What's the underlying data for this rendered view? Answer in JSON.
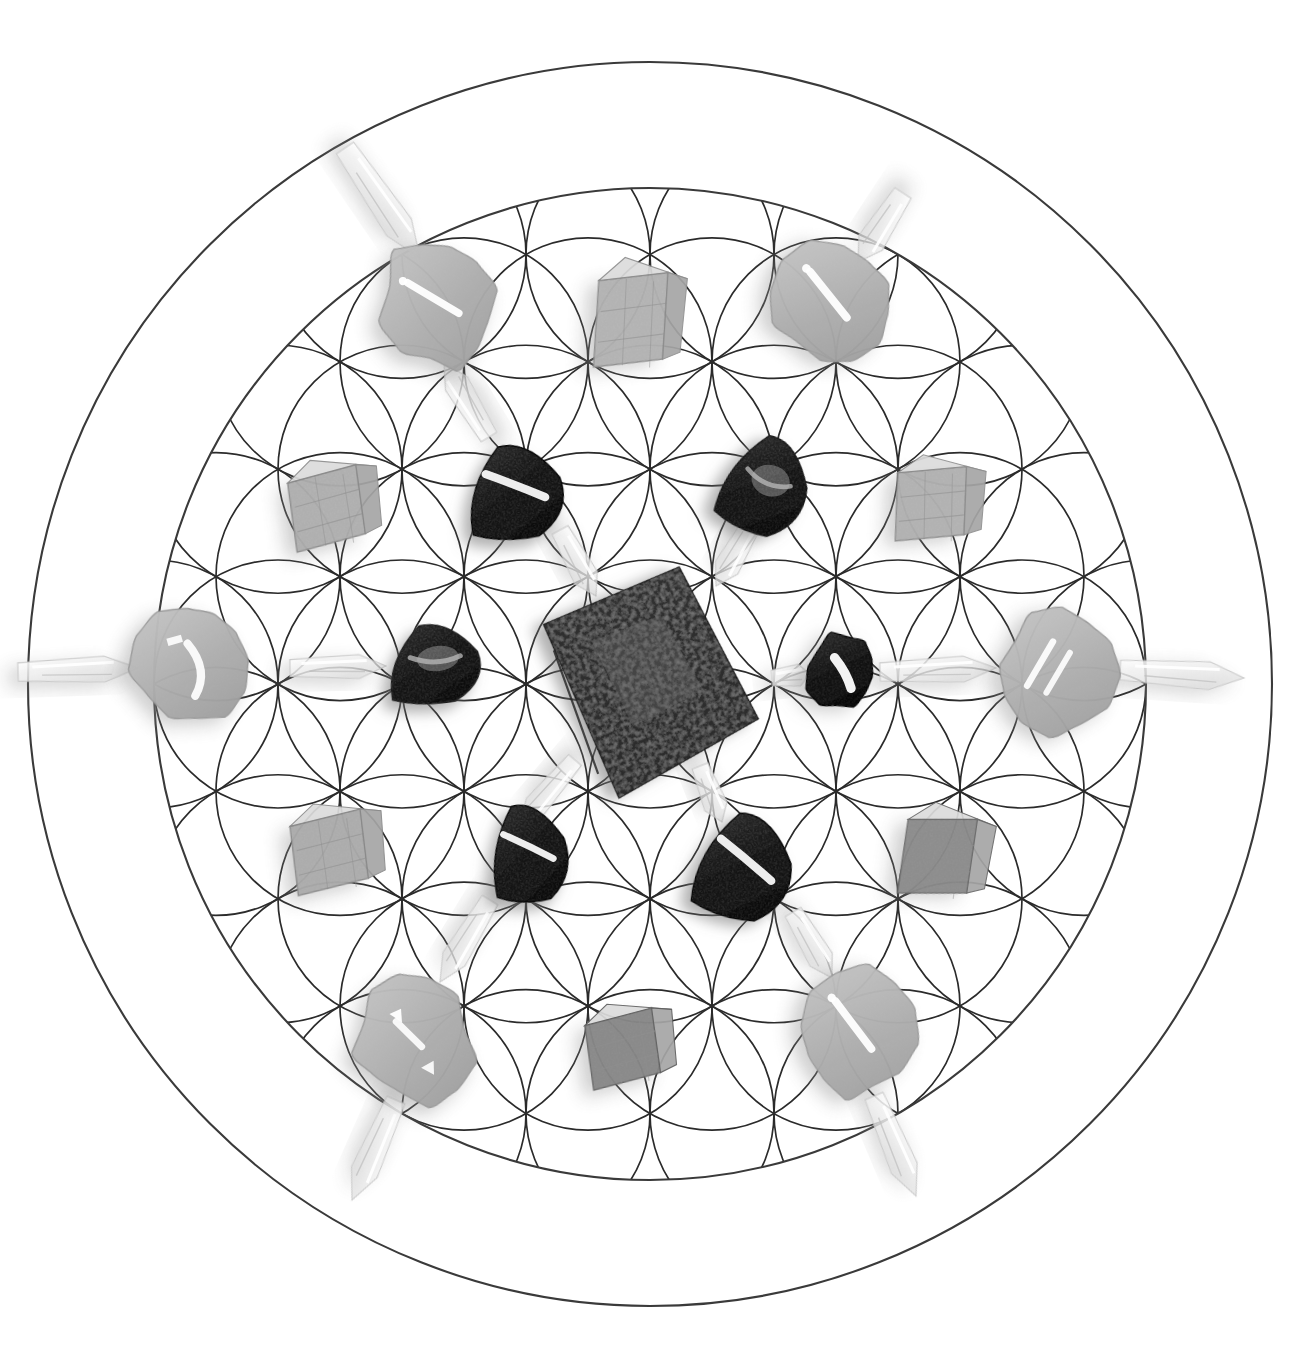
{
  "artwork": {
    "title": "Flower of Life Crystal Grid",
    "background_color": "#ffffff",
    "line_color": "#2b2b2b",
    "canvas": {
      "width": 1302,
      "height": 1365
    }
  },
  "geometry": {
    "name": "flower-of-life",
    "center_x": 650,
    "center_y": 684,
    "cell_radius": 124,
    "rings": 3,
    "outer_circle_radius": 622,
    "inner_boundary_radius": 496,
    "line_width": 1.7
  },
  "stones": [
    {
      "id": "s01",
      "name": "rose-quartz-tumble-top-left",
      "type": "tumbled-oval",
      "cx": 440,
      "cy": 305,
      "rx": 58,
      "ry": 70,
      "rot": -14,
      "fill": "#b9b9b9",
      "edge": "#9a9a9a",
      "sheen": "diagonal-streak"
    },
    {
      "id": "s02",
      "name": "clear-quartz-cube-top-center",
      "type": "rough-cube",
      "cx": 640,
      "cy": 315,
      "rx": 44,
      "ry": 56,
      "rot": 5,
      "fill": "#c8c8c8",
      "edge": "#8f8f8f",
      "sheen": "crystal-facets"
    },
    {
      "id": "s03",
      "name": "rose-quartz-tumble-top-right",
      "type": "tumbled-oval",
      "cx": 832,
      "cy": 303,
      "rx": 62,
      "ry": 62,
      "rot": 12,
      "fill": "#bcbcbc",
      "edge": "#9b9b9b",
      "sheen": "diagonal-streak"
    },
    {
      "id": "s04",
      "name": "calcite-cube-upper-left",
      "type": "rough-cube",
      "cx": 335,
      "cy": 503,
      "rx": 45,
      "ry": 45,
      "rot": -6,
      "fill": "#c2c2c2",
      "edge": "#8d8d8d",
      "sheen": "crystal-facets"
    },
    {
      "id": "s05",
      "name": "black-tourmaline-upper-left",
      "type": "tumbled-tri",
      "cx": 517,
      "cy": 491,
      "rx": 52,
      "ry": 50,
      "rot": -8,
      "fill": "#171717",
      "edge": "#000000",
      "sheen": "bright-streak"
    },
    {
      "id": "s06",
      "name": "dark-jasper-upper-right",
      "type": "tumbled-tri",
      "cx": 767,
      "cy": 485,
      "rx": 46,
      "ry": 52,
      "rot": 16,
      "fill": "#3a3a3a",
      "edge": "#141414",
      "sheen": "mottled"
    },
    {
      "id": "s07",
      "name": "calcite-cube-upper-right",
      "type": "rough-cube",
      "cx": 940,
      "cy": 500,
      "rx": 44,
      "ry": 44,
      "rot": 4,
      "fill": "#c6c6c6",
      "edge": "#909090",
      "sheen": "crystal-facets"
    },
    {
      "id": "s08",
      "name": "rose-quartz-tumble-left",
      "type": "tumbled-oval",
      "cx": 192,
      "cy": 665,
      "rx": 58,
      "ry": 62,
      "rot": -4,
      "fill": "#b7b7b7",
      "edge": "#999999",
      "sheen": "hook-streak"
    },
    {
      "id": "s09",
      "name": "dark-tumble-center-left",
      "type": "tumbled-tri",
      "cx": 436,
      "cy": 663,
      "rx": 50,
      "ry": 42,
      "rot": -7,
      "fill": "#4a4a4a",
      "edge": "#1f1f1f",
      "sheen": "veined"
    },
    {
      "id": "s10",
      "name": "magnetite-square-center",
      "type": "rough-slab",
      "cx": 648,
      "cy": 682,
      "rx": 118,
      "ry": 118,
      "rot": 22,
      "fill": "#4e4e4e",
      "edge": "#1b1b1b",
      "sheen": "speckled"
    },
    {
      "id": "s11",
      "name": "black-obsidian-center-right",
      "type": "tumbled-oval",
      "cx": 843,
      "cy": 672,
      "rx": 36,
      "ry": 42,
      "rot": 10,
      "fill": "#131313",
      "edge": "#000000",
      "sheen": "bright-streak"
    },
    {
      "id": "s12",
      "name": "rose-quartz-tumble-right",
      "type": "tumbled-oval",
      "cx": 1056,
      "cy": 670,
      "rx": 60,
      "ry": 62,
      "rot": 6,
      "fill": "#b5b5b5",
      "edge": "#989898",
      "sheen": "double-streak"
    },
    {
      "id": "s13",
      "name": "calcite-cube-lower-left",
      "type": "rough-cube",
      "cx": 338,
      "cy": 847,
      "rx": 46,
      "ry": 45,
      "rot": -5,
      "fill": "#bdbdbd",
      "edge": "#8b8b8b",
      "sheen": "crystal-facets"
    },
    {
      "id": "s14",
      "name": "black-tourmaline-lower-left",
      "type": "tumbled-tri",
      "cx": 530,
      "cy": 852,
      "rx": 42,
      "ry": 52,
      "rot": -10,
      "fill": "#141414",
      "edge": "#000000",
      "sheen": "bright-streak"
    },
    {
      "id": "s15",
      "name": "black-obsidian-lower-center",
      "type": "tumbled-tri",
      "cx": 746,
      "cy": 866,
      "rx": 52,
      "ry": 56,
      "rot": 8,
      "fill": "#101010",
      "edge": "#000000",
      "sheen": "bright-streak"
    },
    {
      "id": "s16",
      "name": "grey-quartz-lower-right",
      "type": "rough-cube",
      "cx": 947,
      "cy": 853,
      "rx": 44,
      "ry": 48,
      "rot": 10,
      "fill": "#8f8f8f",
      "edge": "#6a6a6a",
      "sheen": "mottled"
    },
    {
      "id": "s17",
      "name": "rose-quartz-tumble-bottom-left",
      "type": "tumbled-oval",
      "cx": 414,
      "cy": 1040,
      "rx": 62,
      "ry": 68,
      "rot": -12,
      "fill": "#b8b8b8",
      "edge": "#9a9a9a",
      "sheen": "triangle-facets"
    },
    {
      "id": "s18",
      "name": "smoky-quartz-cube-bottom",
      "type": "rough-cube",
      "cx": 631,
      "cy": 1044,
      "rx": 44,
      "ry": 42,
      "rot": -6,
      "fill": "#8a8a8a",
      "edge": "#5f5f5f",
      "sheen": "speckled"
    },
    {
      "id": "s19",
      "name": "rose-quartz-tumble-bottom-right",
      "type": "tumbled-oval",
      "cx": 857,
      "cy": 1034,
      "rx": 60,
      "ry": 68,
      "rot": 10,
      "fill": "#bababa",
      "edge": "#9b9b9b",
      "sheen": "diagonal-streak"
    }
  ],
  "quartz_points": [
    {
      "id": "q01",
      "name": "quartz-point-north-west-outer",
      "x1": 345,
      "y1": 148,
      "x2": 420,
      "y2": 258,
      "w": 30
    },
    {
      "id": "q02",
      "name": "quartz-point-north-west-inner",
      "x1": 489,
      "y1": 437,
      "x2": 444,
      "y2": 363,
      "w": 26
    },
    {
      "id": "q03",
      "name": "quartz-point-north-east-outer",
      "x1": 903,
      "y1": 193,
      "x2": 858,
      "y2": 262,
      "w": 28
    },
    {
      "id": "q04",
      "name": "quartz-point-center-upper",
      "x1": 560,
      "y1": 530,
      "x2": 596,
      "y2": 596,
      "w": 26
    },
    {
      "id": "q05",
      "name": "quartz-point-center-upper-right",
      "x1": 754,
      "y1": 520,
      "x2": 716,
      "y2": 586,
      "w": 26
    },
    {
      "id": "q06",
      "name": "quartz-point-west-edge",
      "x1": 18,
      "y1": 672,
      "x2": 138,
      "y2": 668,
      "w": 26
    },
    {
      "id": "q07",
      "name": "quartz-point-center-west",
      "x1": 290,
      "y1": 668,
      "x2": 386,
      "y2": 666,
      "w": 24
    },
    {
      "id": "q08",
      "name": "quartz-point-center-east",
      "x1": 772,
      "y1": 678,
      "x2": 810,
      "y2": 674,
      "w": 22
    },
    {
      "id": "q09",
      "name": "quartz-point-east-inner",
      "x1": 880,
      "y1": 672,
      "x2": 996,
      "y2": 668,
      "w": 26
    },
    {
      "id": "q10",
      "name": "quartz-point-east-edge",
      "x1": 1120,
      "y1": 670,
      "x2": 1244,
      "y2": 678,
      "w": 28
    },
    {
      "id": "q11",
      "name": "quartz-point-center-lower-left",
      "x1": 575,
      "y1": 760,
      "x2": 520,
      "y2": 824,
      "w": 24
    },
    {
      "id": "q12",
      "name": "quartz-point-center-lower",
      "x1": 700,
      "y1": 766,
      "x2": 722,
      "y2": 822,
      "w": 24
    },
    {
      "id": "q13",
      "name": "quartz-point-south-west",
      "x1": 490,
      "y1": 900,
      "x2": 440,
      "y2": 982,
      "w": 26
    },
    {
      "id": "q14",
      "name": "quartz-point-south-east",
      "x1": 793,
      "y1": 912,
      "x2": 832,
      "y2": 978,
      "w": 26
    },
    {
      "id": "q15",
      "name": "quartz-point-south-west-outer",
      "x1": 396,
      "y1": 1100,
      "x2": 352,
      "y2": 1200,
      "w": 28
    },
    {
      "id": "q16",
      "name": "quartz-point-south-east-outer",
      "x1": 874,
      "y1": 1096,
      "x2": 916,
      "y2": 1196,
      "w": 28
    }
  ]
}
